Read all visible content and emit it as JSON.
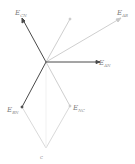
{
  "diagram": {
    "type": "phasor-diagram",
    "origin": {
      "x": 46,
      "y": 62
    },
    "colors": {
      "dark": "#4a4a4a",
      "light": "#c8c8c8",
      "label": "#777777"
    },
    "vectors": [
      {
        "name": "E_CN",
        "label_main": "E",
        "label_sub": "CN",
        "to": {
          "x": 22,
          "y": 18
        },
        "style": "dark"
      },
      {
        "name": "unlabeled",
        "label_main": "",
        "label_sub": "",
        "to": {
          "x": 70,
          "y": 19
        },
        "style": "light"
      },
      {
        "name": "E_AB",
        "label_main": "E",
        "label_sub": "AB",
        "to": {
          "x": 121,
          "y": 18
        },
        "style": "light"
      },
      {
        "name": "E_AN",
        "label_main": "E",
        "label_sub": "AN",
        "to": {
          "x": 100,
          "y": 62
        },
        "style": "dark"
      },
      {
        "name": "E_BN",
        "label_main": "E",
        "label_sub": "BN",
        "to": {
          "x": 22,
          "y": 107
        },
        "style": "dark"
      },
      {
        "name": "E_NC",
        "label_main": "E",
        "label_sub": "NC",
        "to": {
          "x": 70,
          "y": 106
        },
        "style": "light"
      }
    ],
    "bottom_point_label": "C",
    "labels": {
      "cn": {
        "main": "E",
        "sub": "CN"
      },
      "ab": {
        "main": "E",
        "sub": "AB"
      },
      "an": {
        "main": "E",
        "sub": "AN"
      },
      "bn": {
        "main": "E",
        "sub": "BN"
      },
      "nc": {
        "main": "E",
        "sub": "NC"
      },
      "c": "C"
    }
  }
}
